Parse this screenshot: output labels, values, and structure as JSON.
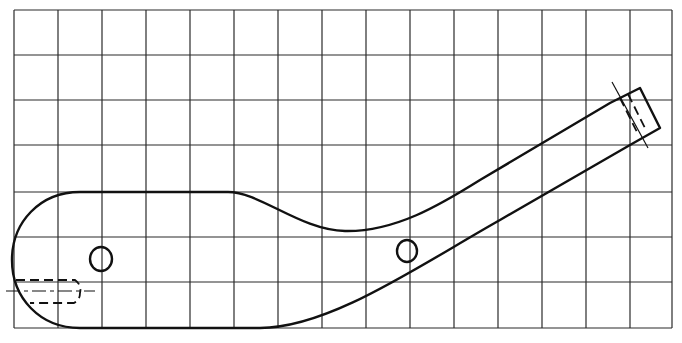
{
  "figure": {
    "grid": {
      "columns": 15,
      "rows": 7,
      "x_lines": [
        14,
        58,
        102,
        146,
        190,
        234,
        278,
        322,
        366,
        410,
        454,
        498,
        542,
        586,
        630,
        672
      ],
      "y_lines": [
        10,
        55,
        100,
        145,
        192,
        237,
        282,
        328
      ],
      "line_color": "#2a2a2a"
    },
    "part": {
      "outline_color": "#111111",
      "holes": [
        {
          "name": "left-hole",
          "cx": 101,
          "cy": 259,
          "rx": 11,
          "ry": 12
        },
        {
          "name": "right-hole",
          "cx": 407,
          "cy": 251,
          "rx": 10,
          "ry": 11
        }
      ],
      "features": [
        "rounded-left-end",
        "dashed-bore-at-left-end",
        "angled-handle-end-with-dashed-tenon"
      ]
    }
  }
}
